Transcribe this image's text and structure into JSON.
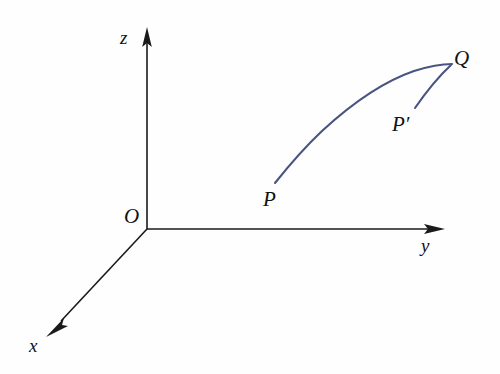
{
  "figure": {
    "type": "3d-coordinate-axes-diagram",
    "background_color": "#fefefe",
    "axis_color": "#1a1a1a",
    "curve_color": "#4a5482",
    "canvas": {
      "width": 500,
      "height": 374
    }
  },
  "axes": {
    "origin": {
      "label": "O",
      "x": 147,
      "y": 229,
      "label_x": 124,
      "label_y": 206
    },
    "items": [
      {
        "name": "z-axis",
        "label": "z",
        "label_x": 120,
        "label_y": 28,
        "from": {
          "x": 147,
          "y": 229
        },
        "to": {
          "x": 147,
          "y": 30
        },
        "direction": "up"
      },
      {
        "name": "y-axis",
        "label": "y",
        "label_x": 421,
        "label_y": 236,
        "from": {
          "x": 147,
          "y": 229
        },
        "to": {
          "x": 443,
          "y": 229
        },
        "direction": "right"
      },
      {
        "name": "x-axis",
        "label": "x",
        "label_x": 29,
        "label_y": 336,
        "from": {
          "x": 147,
          "y": 229
        },
        "to": {
          "x": 50,
          "y": 333
        },
        "direction": "down-left"
      }
    ]
  },
  "points": [
    {
      "name": "point-P",
      "label": "P",
      "label_x": 263,
      "label_y": 189,
      "x": 275,
      "y": 183
    },
    {
      "name": "point-P-prime",
      "label": "P′",
      "label_x": 392,
      "label_y": 114,
      "x": 415,
      "y": 108
    },
    {
      "name": "point-Q",
      "label": "Q",
      "label_x": 454,
      "label_y": 48,
      "x": 452,
      "y": 65
    }
  ],
  "curves": [
    {
      "name": "main-path-P-to-Q",
      "from_label": "P",
      "to_label": "Q",
      "d": "M 275 183 C 291 163 305 147 322 131 C 348 107 382 82 414 71 C 430 66 444 64 452 64",
      "color": "#4a5482"
    },
    {
      "name": "alternate-path-Pprime-to-Q",
      "from_label": "P′",
      "to_label": "Q",
      "d": "M 415 108 C 424 95 437 78 451 65",
      "color": "#4a5482"
    }
  ]
}
